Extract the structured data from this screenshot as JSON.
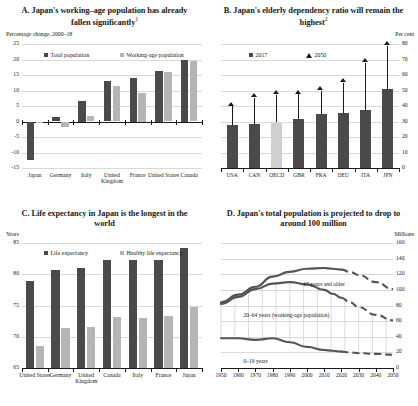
{
  "figure": {
    "width": 418,
    "height": 406,
    "colors": {
      "dark_gray": "#4a4a4a",
      "light_gray": "#b5b5b5",
      "pale_gray": "#cfcfcf",
      "axis": "#1a1a1a",
      "grid": "#d9d9d9",
      "line": "#555555"
    }
  },
  "chart_data": [
    {
      "id": "A",
      "type": "bar",
      "title": "A. Japan's working–age population has already fallen significantly",
      "title_footnote": "1",
      "ylabel": "Percentage change, 2000–18",
      "xlabel": "",
      "ylim": [
        -15,
        25
      ],
      "yticks": [
        -15,
        -10,
        -5,
        0,
        5,
        10,
        15,
        20,
        25
      ],
      "grid": true,
      "legend_position": "top-inside",
      "categories": [
        "Japan",
        "Germany",
        "Italy",
        "United Kingdom",
        "France",
        "United States",
        "Canada"
      ],
      "series": [
        {
          "name": "Total population",
          "color": "#4a4a4a",
          "values": [
            -12.5,
            1.4,
            6.6,
            13.0,
            14.2,
            16.3,
            20.0
          ]
        },
        {
          "name": "Working-age population",
          "color": "#b5b5b5",
          "values": [
            -0.1,
            -1.6,
            1.7,
            11.4,
            9.2,
            16.0,
            19.6
          ]
        }
      ]
    },
    {
      "id": "B",
      "type": "bar",
      "title": "B. Japan's elderly dependency ratio will remain the highest",
      "title_footnote": "2",
      "ylabel": "Per cent",
      "xlabel": "",
      "ylim": [
        0,
        80
      ],
      "yticks": [
        0,
        10,
        20,
        30,
        40,
        50,
        60,
        70,
        80
      ],
      "grid": true,
      "y_axis_side": "right",
      "legend_position": "top-inside",
      "categories": [
        "USA",
        "CAN",
        "OECD",
        "GBR",
        "FRA",
        "DEU",
        "ITA",
        "JPN"
      ],
      "series": [
        {
          "name": "2017",
          "marker": "bar",
          "color": "#4a4a4a",
          "values": [
            28.0,
            28.6,
            29.3,
            31.5,
            35.0,
            35.2,
            37.5,
            50.7
          ]
        },
        {
          "name": "2050",
          "marker": "triangle",
          "color": "#1a1a1a",
          "values": [
            40.0,
            45.5,
            47.2,
            47.5,
            50.0,
            55.0,
            68.0,
            79.0
          ]
        }
      ]
    },
    {
      "id": "C",
      "type": "bar",
      "title": "C. Life expectancy in Japan is the longest in the world",
      "title_footnote": "",
      "ylabel": "Years",
      "xlabel": "",
      "ylim": [
        65,
        85
      ],
      "yticks": [
        65,
        70,
        75,
        80,
        85
      ],
      "grid": true,
      "legend_position": "top-inside",
      "categories": [
        "United States",
        "Germany",
        "United Kingdom",
        "Canada",
        "Italy",
        "France",
        "Japan"
      ],
      "series": [
        {
          "name": "Life expectancy",
          "color": "#4a4a4a",
          "values": [
            78.9,
            80.7,
            81.0,
            82.3,
            82.3,
            82.3,
            84.2
          ]
        },
        {
          "name": "Healthy life expectancy",
          "color": "#b5b5b5",
          "values": [
            68.5,
            71.4,
            71.6,
            73.2,
            73.0,
            73.4,
            74.8
          ]
        }
      ]
    },
    {
      "id": "D",
      "type": "line",
      "title": "D. Japan's total population is projected to drop to around 100 million",
      "title_footnote": "",
      "ylabel": "Millions",
      "xlabel": "",
      "ylim": [
        0,
        160
      ],
      "yticks": [
        0,
        20,
        40,
        60,
        80,
        100,
        120,
        140,
        160
      ],
      "xlim": [
        1950,
        2050
      ],
      "xticks": [
        1950,
        1960,
        1970,
        1980,
        1990,
        2000,
        2010,
        2020,
        2030,
        2040,
        2050
      ],
      "grid": true,
      "y_axis_side": "right",
      "x": [
        1950,
        1960,
        1970,
        1980,
        1990,
        2000,
        2010,
        2015,
        2020,
        2025,
        2030,
        2040,
        2050
      ],
      "series": [
        {
          "name": "Total population",
          "annotation": "65 years and older",
          "color": "#555555",
          "values": [
            84,
            94,
            104,
            117,
            123,
            127,
            128,
            127,
            126,
            123,
            119,
            110,
            101
          ],
          "solid_until": 2020
        },
        {
          "name": "20–64 years (working-age population)",
          "annotation": "20–64 years (working-age population)",
          "color": "#555555",
          "values": [
            82,
            91,
            101,
            108,
            110,
            107,
            100,
            95,
            90,
            84,
            78,
            68,
            61
          ],
          "solid_until": 2020
        },
        {
          "name": "0–19 years",
          "annotation": "0–19 years",
          "color": "#555555",
          "values": [
            38,
            38,
            36,
            38,
            33,
            27,
            23,
            22,
            21,
            20,
            19,
            18,
            17
          ],
          "solid_until": 2020
        }
      ]
    }
  ]
}
